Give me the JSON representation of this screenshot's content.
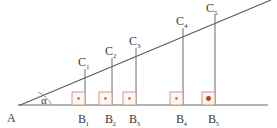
{
  "figure": {
    "background_color": "#ffffff",
    "line_color": "#585858",
    "label_color": "#3a3a3a",
    "rightangle_box_color": "#c8907e",
    "rightangle_dot_color": "#b06a52",
    "rightangle_dot_color_emphasis": "#a6421f",
    "vertex_a": {
      "label": "A",
      "x": 20,
      "y": 105
    },
    "angle_marker": {
      "label": "α",
      "x": 44,
      "y": 102
    },
    "baseline": {
      "x1": 18,
      "y1": 105,
      "x2": 268,
      "y2": 105
    },
    "hypotenuse": {
      "x1": 19,
      "y1": 105.5,
      "x2": 271,
      "y2": 0
    },
    "verticals": [
      {
        "base_label": "B",
        "base_sub": "1",
        "top_label": "C",
        "top_sub": "1",
        "x": 85,
        "y_base": 105,
        "y_top": 69,
        "box_emphasis": false
      },
      {
        "base_label": "B",
        "base_sub": "2",
        "top_label": "C",
        "top_sub": "2",
        "x": 112,
        "y_base": 105,
        "y_top": 58,
        "box_emphasis": false
      },
      {
        "base_label": "B",
        "base_sub": "3",
        "top_label": "C",
        "top_sub": "3",
        "x": 136,
        "y_base": 105,
        "y_top": 48,
        "box_emphasis": false
      },
      {
        "base_label": "B",
        "base_sub": "4",
        "top_label": "C",
        "top_sub": "4",
        "x": 183,
        "y_base": 105,
        "y_top": 28,
        "box_emphasis": false
      },
      {
        "base_label": "B",
        "base_sub": "5",
        "top_label": "C",
        "top_sub": "5",
        "x": 215,
        "y_base": 105,
        "y_top": 14,
        "box_emphasis": true
      }
    ],
    "labels": {
      "a_text": "A",
      "alpha_text": "α",
      "b1": "B",
      "b1_sub": "1",
      "b2": "B",
      "b2_sub": "2",
      "b3": "B",
      "b3_sub": "3",
      "b4": "B",
      "b4_sub": "4",
      "b5": "B",
      "b5_sub": "5",
      "c1": "C",
      "c1_sub": "1",
      "c2": "C",
      "c2_sub": "2",
      "c3": "C",
      "c3_sub": "3",
      "c4": "C",
      "c4_sub": "4",
      "c5": "C",
      "c5_sub": "5"
    }
  }
}
